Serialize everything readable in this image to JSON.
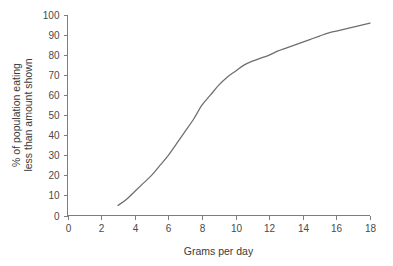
{
  "chart_data": {
    "type": "line",
    "title": "",
    "subtitle": "",
    "xlabel": "Grams per day",
    "ylabel": "% of population eating less than amount shown",
    "ylabel_lines": [
      "% of population eating",
      "less than amount shown"
    ],
    "xlim": [
      0,
      18
    ],
    "ylim": [
      0,
      100
    ],
    "xticks": [
      0,
      2,
      4,
      6,
      8,
      10,
      12,
      14,
      16,
      18
    ],
    "yticks": [
      0,
      10,
      20,
      30,
      40,
      50,
      60,
      70,
      80,
      90,
      100
    ],
    "xtick_labels": [
      "0",
      "2",
      "4",
      "6",
      "8",
      "10",
      "12",
      "14",
      "16",
      "18"
    ],
    "ytick_labels": [
      "0",
      "10",
      "20",
      "30",
      "40",
      "50",
      "60",
      "70",
      "80",
      "90",
      "100"
    ],
    "grid": false,
    "legend": false,
    "legend_position": "none",
    "series": [
      {
        "name": "Cumulative population",
        "color": "#6e6e6e",
        "x": [
          3.0,
          3.5,
          4.0,
          4.5,
          5.0,
          5.5,
          6.0,
          6.5,
          7.0,
          7.5,
          8.0,
          8.5,
          9.0,
          9.5,
          10.0,
          10.5,
          11.0,
          11.5,
          12.0,
          12.5,
          13.0,
          13.5,
          14.0,
          14.5,
          15.0,
          15.5,
          16.0,
          16.5,
          17.0,
          17.5,
          18.0
        ],
        "values": [
          5,
          8,
          12,
          16,
          20,
          25,
          30,
          36,
          42,
          48,
          55,
          60,
          65,
          69,
          72,
          75,
          77,
          78.5,
          80,
          82,
          83.5,
          85,
          86.5,
          88,
          89.5,
          91,
          92,
          93,
          94,
          95,
          96
        ]
      }
    ],
    "annotations": []
  },
  "axes": {
    "x_axis_name": "x-axis",
    "y_axis_name": "y-axis"
  }
}
